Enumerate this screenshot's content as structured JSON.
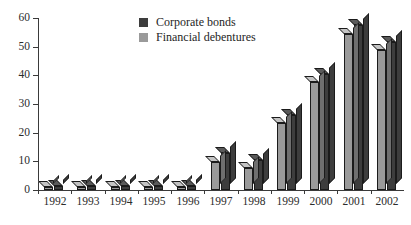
{
  "chart_data": {
    "type": "bar",
    "title": "",
    "subtitle": "",
    "xlabel": "",
    "ylabel": "",
    "categories": [
      "1992",
      "1993",
      "1994",
      "1995",
      "1996",
      "1997",
      "1998",
      "1999",
      "2000",
      "2001",
      "2002"
    ],
    "series": [
      {
        "name": "Financial debentures",
        "color": "#9a9a9a",
        "values": [
          1.2,
          1.2,
          1.2,
          1.0,
          1.0,
          9.8,
          7.6,
          23.3,
          37.8,
          54.5,
          48.8
        ]
      },
      {
        "name": "Corporate bonds",
        "color": "#3d3d3d",
        "values": [
          1.5,
          1.5,
          1.5,
          1.3,
          1.3,
          12.8,
          10.3,
          26.0,
          40.5,
          57.5,
          51.5
        ]
      }
    ],
    "ylim": [
      0,
      60
    ],
    "yticks": [
      0,
      10,
      20,
      30,
      40,
      50,
      60
    ],
    "ytick_labels": [
      "0",
      "10",
      "20",
      "30",
      "40",
      "50",
      "60"
    ],
    "grid": false,
    "legend_position": "top-center",
    "style": "3d-bars",
    "bar_order_in_group": [
      "Financial debentures",
      "Corporate bonds"
    ]
  },
  "legend": {
    "items": [
      {
        "label": "Corporate bonds",
        "color": "#3d3d3d"
      },
      {
        "label": "Financial debentures",
        "color": "#9a9a9a"
      }
    ]
  },
  "axes": {
    "y_labels": [
      "60",
      "50",
      "40",
      "30",
      "20",
      "10",
      "0"
    ],
    "x_labels": [
      "1992",
      "1993",
      "1994",
      "1995",
      "1996",
      "1997",
      "1998",
      "1999",
      "2000",
      "2001",
      "2002"
    ]
  },
  "colors": {
    "dark_series": "#3d3d3d",
    "light_series": "#9a9a9a",
    "dark_top": "#5a5a5a",
    "light_top": "#c4c4c4",
    "axis": "#3a3a3a",
    "text": "#2b2b2b",
    "background": "#ffffff"
  }
}
